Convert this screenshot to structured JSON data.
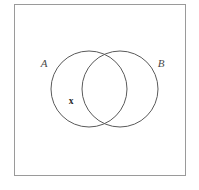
{
  "figure": {
    "type": "venn-diagram",
    "background_color": "#ffffff",
    "universal_set_box": {
      "name": "universal-set-rectangle",
      "x": 14,
      "y": 4,
      "width": 172,
      "height": 172,
      "stroke_color": "#9a9a9a",
      "stroke_width": 1,
      "fill": "none"
    },
    "stroke_color": "#5a5a5a",
    "circles": [
      {
        "id": "A",
        "name": "set-a-circle",
        "cx": 89,
        "cy": 89,
        "r": 38,
        "fill": "none",
        "stroke_color": "#5a5a5a",
        "stroke_width": 1
      },
      {
        "id": "B",
        "name": "set-b-circle",
        "cx": 120,
        "cy": 89,
        "r": 38,
        "fill": "none",
        "stroke_color": "#5a5a5a",
        "stroke_width": 1
      }
    ],
    "labels": {
      "set_a": "A",
      "set_b": "B",
      "element_x": "x"
    },
    "label_positions": {
      "set_a": {
        "x": 44,
        "y": 67
      },
      "set_b": {
        "x": 158,
        "y": 67
      },
      "element_x": {
        "x": 68,
        "y": 104
      }
    },
    "caption": {
      "text": "",
      "visible": false
    }
  }
}
